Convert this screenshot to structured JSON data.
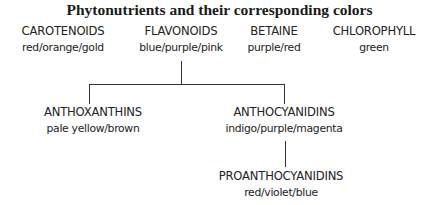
{
  "title": "Phytonutrients and their corresponding colors",
  "nodes": {
    "carotenoids": {
      "name": "CAROTENOIDS",
      "colors": "red/orange/gold"
    },
    "flavonoids": {
      "name": "FLAVONOIDS",
      "colors": "blue/purple/pink"
    },
    "betaine": {
      "name": "BETAINE",
      "colors": "purple/red"
    },
    "chlorophyll": {
      "name": "CHLOROPHYLL",
      "colors": "green"
    },
    "anthoxanthins": {
      "name": "ANTHOXANTHINS",
      "colors": "pale yellow/brown"
    },
    "anthocyanidins": {
      "name": "ANTHOCYANIDINS",
      "colors": "indigo/purple/magenta"
    },
    "proanthocyanidins": {
      "name": "PROANTHOCYANIDINS",
      "colors": "red/violet/blue"
    }
  },
  "edges": [
    {
      "from": "flavonoids",
      "to": "anthoxanthins"
    },
    {
      "from": "flavonoids",
      "to": "anthocyanidins"
    },
    {
      "from": "anthocyanidins",
      "to": "proanthocyanidins"
    }
  ],
  "line_color": "#333333"
}
